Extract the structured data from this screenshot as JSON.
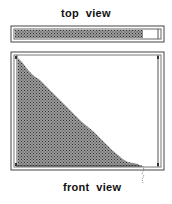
{
  "top_view": {
    "label": "top  view",
    "fill_fraction": 0.86
  },
  "front_view": {
    "label": "front  view"
  },
  "colors": {
    "frame": "#555555",
    "fill": "#777777",
    "background": "#ffffff",
    "text": "#111111"
  }
}
